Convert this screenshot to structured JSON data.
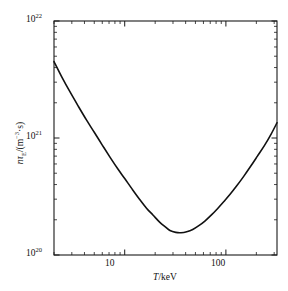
{
  "figure": {
    "background_color": "#ffffff",
    "frame_color": "#1a1a1a",
    "curve_color": "#111111"
  },
  "axes": {
    "x": {
      "title_prefix": "T",
      "title_suffix": "/keV",
      "major_tick_labels": [
        "10",
        "100"
      ],
      "major_tick_values": [
        10,
        100
      ],
      "scale": "log",
      "min": 2,
      "max": 320
    },
    "y": {
      "title_prefix": "n",
      "title_sub": "E",
      "title_tau": "τ",
      "title_suffix": "/(m",
      "title_exp": "−3",
      "title_tail": "·s)",
      "major_tick_labels": [
        "10",
        "10",
        "10"
      ],
      "major_tick_exponents": [
        "20",
        "21",
        "22"
      ],
      "major_tick_values": [
        1e+20,
        1e+21,
        1e+22
      ],
      "scale": "log",
      "min": 1e+20,
      "max": 1e+22
    }
  },
  "chart_data": {
    "type": "line",
    "title": "",
    "subtitle": "",
    "xlabel": "T/keV",
    "ylabel": "nτE/(m−3·s)",
    "xscale": "log",
    "yscale": "log",
    "xlim": [
      2,
      320
    ],
    "ylim": [
      1e+20,
      1e+22
    ],
    "grid": false,
    "legend": null,
    "xtick_labels": [
      "10",
      "100"
    ],
    "xticks": [
      10,
      100
    ],
    "ytick_labels": [
      "10^20",
      "10^21",
      "10^22"
    ],
    "yticks": [
      1e+20,
      1e+21,
      1e+22
    ],
    "minor_ticks": true,
    "annotations": [],
    "series": [
      {
        "name": "Lawson criterion nτE",
        "color": "#111111",
        "x": [
          2.0,
          2.4,
          2.9,
          3.5,
          4.2,
          5.0,
          6.0,
          7.2,
          8.6,
          10.0,
          12.0,
          14.0,
          16.5,
          19.0,
          22.0,
          25.0,
          28.0,
          32.0,
          36.0,
          41.0,
          47.0,
          54.0,
          62.0,
          72.0,
          83.0,
          95.0,
          110.0,
          128.0,
          150.0,
          175.0,
          205.0,
          240.0,
          280.0,
          320.0
        ],
        "y": [
          4.5e+21,
          3.3e+21,
          2.45e+21,
          1.85e+21,
          1.42e+21,
          1.12e+21,
          8.7e+20,
          6.8e+20,
          5.4e+20,
          4.5e+20,
          3.6e+20,
          3e+20,
          2.5e+20,
          2.2e+20,
          1.92e+20,
          1.75e+20,
          1.62e+20,
          1.56e+20,
          1.55e+20,
          1.58e+20,
          1.65e+20,
          1.78e+20,
          1.95e+20,
          2.2e+20,
          2.5e+20,
          2.85e+20,
          3.3e+20,
          3.9e+20,
          4.7e+20,
          5.7e+20,
          7e+20,
          8.6e+20,
          1.08e+21,
          1.35e+21
        ]
      }
    ]
  }
}
